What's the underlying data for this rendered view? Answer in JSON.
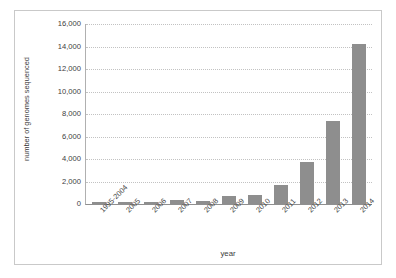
{
  "chart_data": {
    "type": "bar",
    "title": "",
    "xlabel": "year",
    "ylabel": "number of genomes sequenced",
    "categories": [
      "1995-2004",
      "2005",
      "2006",
      "2007",
      "2008",
      "2009",
      "2010",
      "2011",
      "2012",
      "2013",
      "2014"
    ],
    "values": [
      170,
      90,
      190,
      340,
      310,
      700,
      780,
      1700,
      3700,
      7400,
      14200
    ],
    "series": [
      {
        "name": "number of genomes sequenced",
        "values": [
          170,
          90,
          190,
          340,
          310,
          700,
          780,
          1700,
          3700,
          7400,
          14200
        ]
      }
    ],
    "ylim": [
      0,
      16000
    ],
    "ytick_values": [
      0,
      2000,
      4000,
      6000,
      8000,
      10000,
      12000,
      14000,
      16000
    ],
    "ytick_labels": [
      "0",
      "2,000",
      "4,000",
      "6,000",
      "8,000",
      "10,000",
      "12,000",
      "14,000",
      "16,000"
    ],
    "grid": "horizontal-dotted",
    "legend": "none",
    "bar_color": "#8e8e8e",
    "gridline_color": "#c2c2c2",
    "axis_color": "#8f8f8f",
    "text_color": "#3d3d3d",
    "border_color": "#c9c9c9",
    "background": "#ffffff"
  }
}
